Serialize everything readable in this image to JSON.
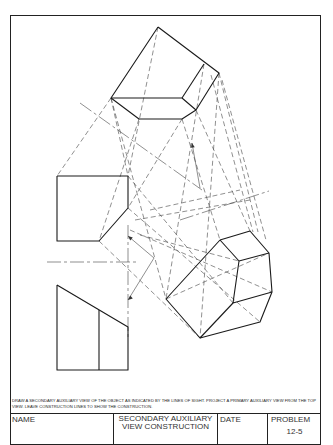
{
  "sheet": {
    "instructions": "Draw a secondary auxiliary view of the object as indicated by the lines of sight. Project a primary auxiliary view from the top view. Leave construction lines to show the construction.",
    "title_block": {
      "name_label": "NAME",
      "title_line1": "SECONDARY AUXILIARY",
      "title_line2": "VIEW CONSTRUCTION",
      "date_label": "DATE",
      "problem_label": "PROBLEM",
      "problem_number": "12-5"
    }
  },
  "drawing": {
    "object_lines": [
      {
        "name": "top-view-outline",
        "points": "158,27 219,73 196,110 182,119 139,119 111,98 158,27"
      },
      {
        "name": "top-view-edge-a",
        "points": "111,98 182,98 196,110"
      },
      {
        "name": "top-view-edge-b",
        "points": "182,98 204,64"
      },
      {
        "name": "front-view-pentagon",
        "points": "57,176 128,176 128,208 99,241 57,241 57,176"
      },
      {
        "name": "side-view-trapezoid",
        "points": "57,285 128,327 128,370 57,370 57,285"
      },
      {
        "name": "side-view-inner-edge",
        "points": "99,310 99,370"
      },
      {
        "name": "aux-view-outline",
        "points": "220,240 250,231 269,253 272,292 260,322 200,338 166,299 220,240"
      },
      {
        "name": "aux-view-face",
        "points": "220,240 239,261 233,303 272,292"
      },
      {
        "name": "aux-view-edge-c",
        "points": "239,261 269,253"
      },
      {
        "name": "aux-view-edge-d",
        "points": "233,303 200,338"
      }
    ],
    "construction_lines": [
      "111,98 57,176",
      "111,98 128,176",
      "139,119 99,241",
      "182,119 128,208",
      "158,27 128,176",
      "204,64 166,299",
      "219,73 200,338",
      "211,75 253,232",
      "219,73 258,232",
      "222,80 266,240",
      "182,119 220,240",
      "196,110 250,231",
      "111,98 166,299",
      "128,176 233,303",
      "128,208 260,322",
      "99,241 200,338",
      "140,235 239,261",
      "130,230 272,292",
      "166,299 269,253",
      "150,210 240,190",
      "135,220 250,200"
    ],
    "center_lines": [
      "80,103 202,190",
      "47,262 138,262",
      "128,225 128,340",
      "180,220 269,191"
    ],
    "thin_lines": [
      "128,236 154,258",
      "154,258 128,300",
      "192,143 200,188"
    ],
    "arrows": [
      {
        "name": "sight-arrow-upper",
        "x": 128,
        "y": 236,
        "angle": 220
      },
      {
        "name": "sight-arrow-lower",
        "x": 128,
        "y": 300,
        "angle": 140
      },
      {
        "name": "sight-arrow-top",
        "x": 192,
        "y": 143,
        "angle": 260
      }
    ]
  }
}
